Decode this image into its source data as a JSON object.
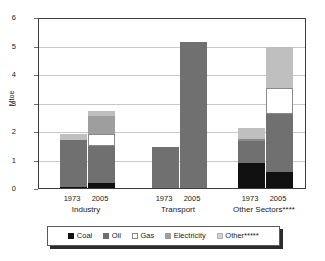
{
  "chart_data": {
    "type": "bar",
    "subtype": "stacked-bar-grouped",
    "title": "",
    "xlabel": "",
    "ylabel": "Mtoe",
    "ylim": [
      0,
      6
    ],
    "yticks": [
      "0",
      "1",
      "2",
      "3",
      "4",
      "5",
      "6"
    ],
    "grid": true,
    "legend_position": "bottom",
    "groups": [
      {
        "name": "Industry",
        "label": "Industry",
        "years": [
          "1973",
          "2005"
        ]
      },
      {
        "name": "Transport",
        "label": "Transport",
        "years": [
          "1973",
          "2005"
        ]
      },
      {
        "name": "Other Sectors",
        "label": "Other Sectors****",
        "years": [
          "1973",
          "2005"
        ]
      }
    ],
    "categories": [
      "Industry 1973",
      "Industry 2005",
      "Transport 1973",
      "Transport 2005",
      "Other Sectors 1973",
      "Other Sectors 2005"
    ],
    "series": [
      {
        "name": "Coal",
        "label": "Coal",
        "color": "#111111",
        "values": [
          0.05,
          0.17,
          0.0,
          0.0,
          0.89,
          0.55
        ]
      },
      {
        "name": "Oil",
        "label": "Oil",
        "color": "#707070",
        "values": [
          1.62,
          1.32,
          1.43,
          5.12,
          0.78,
          2.03
        ]
      },
      {
        "name": "Gas",
        "label": "Gas",
        "color": "#ffffff",
        "values": [
          0.0,
          0.42,
          0.0,
          0.0,
          0.05,
          0.92
        ]
      },
      {
        "name": "Electricity",
        "label": "Electricity",
        "color": "#9e9e9e",
        "values": [
          0.0,
          0.62,
          0.0,
          0.0,
          0.0,
          0.0
        ]
      },
      {
        "name": "Other",
        "label": "Other*****",
        "color": "#bfbfbf",
        "values": [
          0.22,
          0.18,
          0.0,
          0.0,
          0.38,
          1.45
        ]
      }
    ],
    "totals": [
      1.89,
      2.71,
      1.43,
      5.12,
      2.1,
      4.95
    ]
  },
  "legend": {
    "items": [
      {
        "label": "Coal"
      },
      {
        "label": "Oil"
      },
      {
        "label": "Gas"
      },
      {
        "label": "Electricity"
      },
      {
        "label": "Other*****"
      }
    ]
  },
  "axis": {
    "y_title": "Mtoe"
  }
}
